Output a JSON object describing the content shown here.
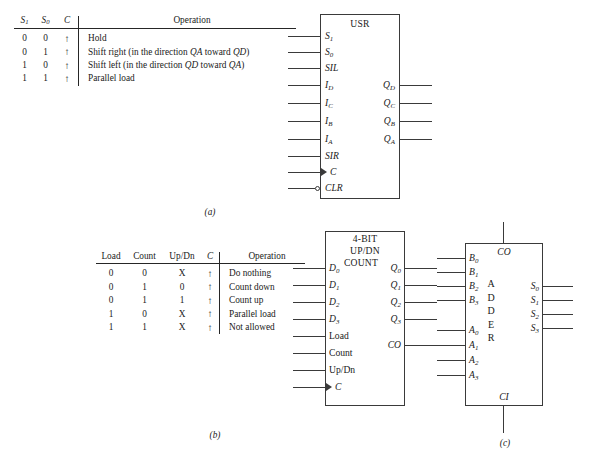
{
  "figure": {
    "captions": {
      "a": "(a)",
      "b": "(b)",
      "c": "(c)"
    }
  },
  "table_a": {
    "headers": [
      "S1",
      "S0",
      "C",
      "Operation"
    ],
    "header_display": [
      "S",
      "S",
      "C",
      "Operation"
    ],
    "header_sub": [
      "1",
      "0",
      "",
      ""
    ],
    "rows": [
      {
        "s1": "0",
        "s0": "0",
        "c": "↑",
        "operation": "Hold"
      },
      {
        "s1": "0",
        "s0": "1",
        "c": "↑",
        "operation": "Shift right (in the direction QA toward QD)"
      },
      {
        "s1": "1",
        "s0": "0",
        "c": "↑",
        "operation": "Shift left (in the direction QD toward QA)"
      },
      {
        "s1": "1",
        "s0": "1",
        "c": "↑",
        "operation": "Parallel load"
      }
    ]
  },
  "table_b": {
    "headers": [
      "Load",
      "Count",
      "Up/Dn",
      "C",
      "Operation"
    ],
    "rows": [
      {
        "load": "0",
        "count": "0",
        "updn": "X",
        "c": "↑",
        "operation": "Do nothing"
      },
      {
        "load": "0",
        "count": "1",
        "updn": "0",
        "c": "↑",
        "operation": "Count down"
      },
      {
        "load": "0",
        "count": "1",
        "updn": "1",
        "c": "↑",
        "operation": "Count up"
      },
      {
        "load": "1",
        "count": "0",
        "updn": "X",
        "c": "↑",
        "operation": "Parallel load"
      },
      {
        "load": "1",
        "count": "1",
        "updn": "X",
        "c": "↑",
        "operation": "Not allowed"
      }
    ]
  },
  "block_usr": {
    "title": "USR",
    "inputs": [
      {
        "label": "S",
        "sub": "1"
      },
      {
        "label": "S",
        "sub": "0"
      },
      {
        "label": "SIL",
        "sub": ""
      },
      {
        "label": "I",
        "sub": "D"
      },
      {
        "label": "I",
        "sub": "C"
      },
      {
        "label": "I",
        "sub": "B"
      },
      {
        "label": "I",
        "sub": "A"
      },
      {
        "label": "SIR",
        "sub": ""
      },
      {
        "label": "C",
        "sub": ""
      },
      {
        "label": "CLR",
        "sub": ""
      }
    ],
    "outputs": [
      {
        "label": "Q",
        "sub": "D"
      },
      {
        "label": "Q",
        "sub": "C"
      },
      {
        "label": "Q",
        "sub": "B"
      },
      {
        "label": "Q",
        "sub": "A"
      }
    ]
  },
  "block_counter": {
    "title_lines": [
      "4-BIT",
      "UP/DN",
      "COUNT"
    ],
    "inputs": [
      {
        "label": "D",
        "sub": "0"
      },
      {
        "label": "D",
        "sub": "1"
      },
      {
        "label": "D",
        "sub": "2"
      },
      {
        "label": "D",
        "sub": "3"
      },
      {
        "label": "Load",
        "sub": ""
      },
      {
        "label": "Count",
        "sub": ""
      },
      {
        "label": "Up/Dn",
        "sub": ""
      },
      {
        "label": "C",
        "sub": ""
      }
    ],
    "outputs": [
      {
        "label": "Q",
        "sub": "0"
      },
      {
        "label": "Q",
        "sub": "1"
      },
      {
        "label": "Q",
        "sub": "2"
      },
      {
        "label": "Q",
        "sub": "3"
      },
      {
        "label": "CO",
        "sub": ""
      }
    ]
  },
  "block_adder": {
    "title_letters": [
      "A",
      "D",
      "D",
      "E",
      "R"
    ],
    "carry_out": "CO",
    "carry_in": "CI",
    "inputs": [
      {
        "label": "B",
        "sub": "0"
      },
      {
        "label": "B",
        "sub": "1"
      },
      {
        "label": "B",
        "sub": "2"
      },
      {
        "label": "B",
        "sub": "3"
      },
      {
        "label": "A",
        "sub": "0"
      },
      {
        "label": "A",
        "sub": "1"
      },
      {
        "label": "A",
        "sub": "2"
      },
      {
        "label": "A",
        "sub": "3"
      }
    ],
    "outputs": [
      {
        "label": "S",
        "sub": "0"
      },
      {
        "label": "S",
        "sub": "1"
      },
      {
        "label": "S",
        "sub": "2"
      },
      {
        "label": "S",
        "sub": "3"
      }
    ]
  },
  "colors": {
    "ink": "#1a1a1a",
    "line": "#3a3a3a",
    "background": "#ffffff"
  }
}
